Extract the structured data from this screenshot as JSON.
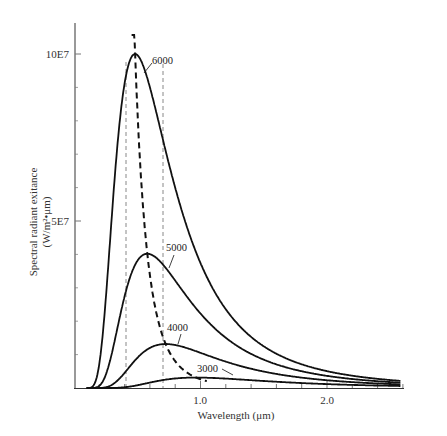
{
  "chart_data": {
    "type": "line",
    "title": "",
    "xlabel": "Wavelength (μm)",
    "ylabel_line1": "Spectral radiant exitance",
    "ylabel_line2": "(W/m²•μm)",
    "xlim": [
      0,
      2.6
    ],
    "ylim": [
      0,
      100000000.0
    ],
    "x_ticks": [
      {
        "value": 1.0,
        "label": "1.0"
      },
      {
        "value": 2.0,
        "label": "2.0"
      }
    ],
    "x_minor_tick_step": 0.2,
    "y_ticks": [
      {
        "value": 100000000.0,
        "label": "10E7"
      },
      {
        "value": 50000000.0,
        "label": "5E7"
      }
    ],
    "y_minor_tick_step": 10000000.0,
    "grid": false,
    "legend": "inline curve labels",
    "series": [
      {
        "name": "6000",
        "temperature_K": 6000,
        "peak_wavelength_um": 0.48,
        "peak_value": 100000000.0
      },
      {
        "name": "5000",
        "temperature_K": 5000,
        "peak_wavelength_um": 0.58,
        "peak_value": 40000000.0
      },
      {
        "name": "4000",
        "temperature_K": 4000,
        "peak_wavelength_um": 0.72,
        "peak_value": 13000000.0
      },
      {
        "name": "3000",
        "temperature_K": 3000,
        "peak_wavelength_um": 0.97,
        "peak_value": 3000000.0
      }
    ],
    "annotations": [
      {
        "type": "dashed-curve",
        "name": "Wien displacement locus",
        "description": "thick dashed line through the peaks of each curve"
      },
      {
        "type": "vertical-dashed-line",
        "x": 0.4,
        "description": "visible band lower bound"
      },
      {
        "type": "vertical-dashed-line",
        "x": 0.7,
        "description": "visible band upper bound"
      }
    ]
  },
  "labels": {
    "y_tick_top": "10E7",
    "y_tick_mid": "5E7",
    "x_tick_1": "1.0",
    "x_tick_2": "2.0",
    "x_axis_title": "Wavelength (μm)",
    "y_axis_title_1": "Spectral radiant exitance",
    "y_axis_title_2": "(W/m²•μm)",
    "curve_6000": "6000",
    "curve_5000": "5000",
    "curve_4000": "4000",
    "curve_3000": "3000"
  },
  "colors": {
    "curve": "#111111",
    "axis": "#555555",
    "dashed_guides": "#888888",
    "background": "#ffffff"
  }
}
